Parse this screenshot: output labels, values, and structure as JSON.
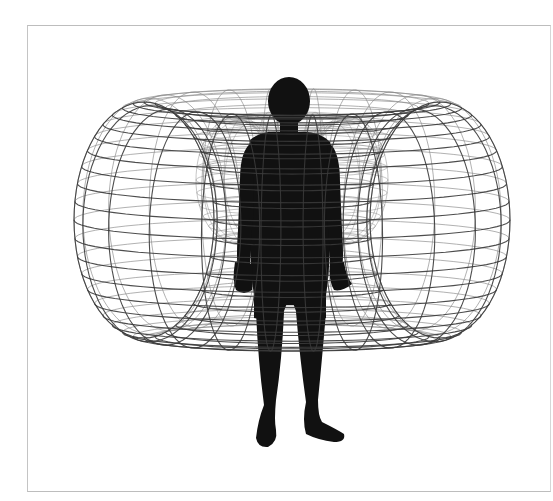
{
  "diagram": {
    "elements": [
      {
        "id": "torus",
        "label": "Toroidal field wireframe"
      },
      {
        "id": "inner-torus",
        "label": "Inner torus (behind body)"
      },
      {
        "id": "human",
        "label": "Human silhouette"
      }
    ]
  },
  "colors": {
    "background": "#ffffff",
    "frame": "#c0c0c0",
    "wire_front": "#3a3a3a",
    "wire_back": "#8a8a8a",
    "silhouette": "#111111"
  },
  "torus": {
    "cx": 292,
    "cy": 220,
    "major_rx": 148,
    "major_ry": 22,
    "tube_rx": 70,
    "tube_ry": 118,
    "rings": 40,
    "meridians": 22
  },
  "inner_torus": {
    "cx": 292,
    "cy": 180,
    "major_rx": 58,
    "major_ry": 10,
    "tube_rx": 38,
    "tube_ry": 62,
    "rings": 30,
    "meridians": 16
  }
}
